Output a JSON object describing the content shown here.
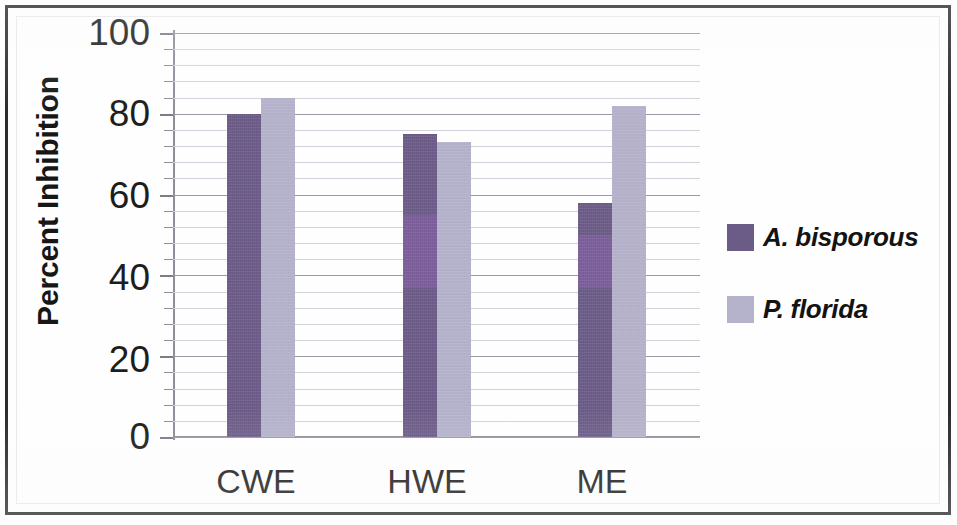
{
  "chart_data": {
    "type": "bar",
    "title": "",
    "subtitle": "",
    "xlabel": "",
    "ylabel": "Percent Inhibition",
    "categories": [
      "CWE",
      "HWE",
      "ME"
    ],
    "series": [
      {
        "name": "A. bisporous",
        "color": "#6b5b87",
        "values": [
          80,
          75,
          58
        ]
      },
      {
        "name": "P. florida",
        "color": "#b5b2cc",
        "values": [
          84,
          73,
          82
        ]
      }
    ],
    "ylim": [
      0,
      100
    ],
    "y_ticks": [
      0,
      20,
      40,
      60,
      80,
      100
    ],
    "y_tick_labels": [
      "0",
      "20",
      "40",
      "60",
      "80",
      "100"
    ],
    "minor_gridlines_per_interval": 5,
    "grid": true,
    "legend_position": "right",
    "bar_group_gap": true
  },
  "axes": {
    "y_title": "Percent Inhibition",
    "y_tick_labels": [
      "100",
      "80",
      "60",
      "40",
      "20",
      "0"
    ],
    "x_tick_labels": [
      "CWE",
      "HWE",
      "ME"
    ]
  },
  "legend": {
    "entries": [
      {
        "label": "A. bisporous",
        "color": "#6b5b87"
      },
      {
        "label": "P. florida",
        "color": "#b5b2cc"
      }
    ]
  },
  "colors": {
    "series_dark": "#6b5b87",
    "series_light": "#b5b2cc",
    "series_dark_highlight": "#7e5e9e",
    "gridline_major": "#9a9aa6",
    "gridline_minor": "#d2d2dc",
    "axis": "#8e8e99",
    "text": "#1d1d1d",
    "frame": "#2b2b2b",
    "background": "#ffffff"
  }
}
